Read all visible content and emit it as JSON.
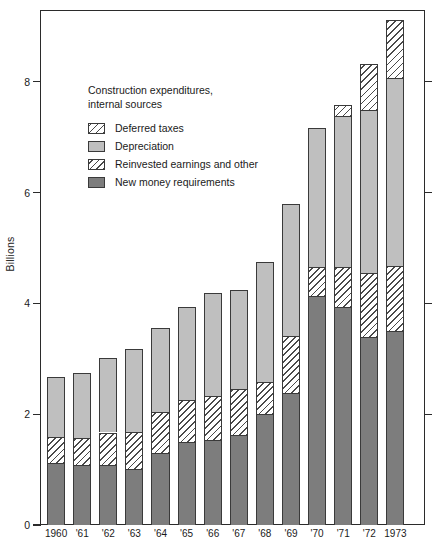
{
  "chart_data": {
    "type": "bar",
    "subtype": "stacked",
    "title": "Construction expenditures, internal sources",
    "xlabel": "",
    "ylabel": "Billions",
    "ylim": [
      0,
      9.3
    ],
    "yticks": [
      0,
      2,
      4,
      6,
      8
    ],
    "ytick_labels": [
      "0",
      "2",
      "4",
      "6",
      "8"
    ],
    "grid": false,
    "legend_position": "upper-left-inside",
    "categories": [
      "1960",
      "'61",
      "'62",
      "'63",
      "'64",
      "'65",
      "'66",
      "'67",
      "'68",
      "'69",
      "'70",
      "'71",
      "'72",
      "1973"
    ],
    "series": [
      {
        "name": "New money requirements",
        "style": "solid-dark-gray",
        "values": [
          1.12,
          1.09,
          1.08,
          1.02,
          1.3,
          1.5,
          1.53,
          1.62,
          2.0,
          2.38,
          4.14,
          3.93,
          3.4,
          3.5
        ]
      },
      {
        "name": "Reinvested earnings and other",
        "style": "hatched-diagonal",
        "values": [
          0.47,
          0.48,
          0.59,
          0.66,
          0.74,
          0.76,
          0.8,
          0.83,
          0.58,
          1.04,
          0.52,
          0.72,
          1.15,
          1.17
        ]
      },
      {
        "name": "Depreciation",
        "style": "solid-light-gray",
        "values": [
          1.09,
          1.18,
          1.34,
          1.49,
          1.52,
          1.67,
          1.85,
          1.8,
          2.16,
          2.38,
          2.51,
          2.73,
          2.95,
          3.4
        ]
      },
      {
        "name": "Deferred taxes",
        "style": "hatched-diagonal-light",
        "values": [
          0.0,
          0.0,
          0.0,
          0.0,
          0.0,
          0.0,
          0.0,
          0.0,
          0.0,
          0.0,
          0.0,
          0.2,
          0.83,
          1.05
        ]
      }
    ],
    "totals": [
      2.68,
      2.75,
      3.01,
      3.17,
      3.56,
      3.93,
      4.18,
      4.25,
      4.74,
      5.8,
      7.17,
      7.58,
      8.33,
      9.12
    ]
  },
  "legend": {
    "title_line1": "Construction expenditures,",
    "title_line2": "   internal sources",
    "items": [
      {
        "label": "Deferred taxes",
        "swatch": "hatched-diagonal-light"
      },
      {
        "label": "Depreciation",
        "swatch": "solid-light-gray"
      },
      {
        "label": "Reinvested earnings and other",
        "swatch": "hatched-diagonal"
      },
      {
        "label": "New money requirements",
        "swatch": "solid-dark-gray"
      }
    ]
  },
  "axis": {
    "y_title": "Billions",
    "y_ticks": [
      "8",
      "6",
      "4",
      "2",
      "0"
    ],
    "x_ticks": [
      "1960",
      "'61",
      "'62",
      "'63",
      "'64",
      "'65",
      "'66",
      "'67",
      "'68",
      "'69",
      "'70",
      "'71",
      "'72",
      "1973"
    ]
  },
  "colors": {
    "new_money": "#7d7d7d",
    "depreciation": "#bfbfbf",
    "hatch_line": "#4a4a4a",
    "frame": "#2b2b2b",
    "background": "#ffffff",
    "text": "#1a1a1a"
  }
}
